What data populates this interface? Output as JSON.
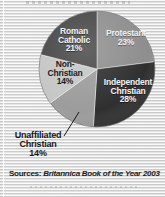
{
  "figure": {
    "background_color": "#dcdcdc",
    "texture": "horizontal-scanline"
  },
  "source_note": {
    "label": "Sources:",
    "title": "Britannica Book of the Year 2003"
  },
  "chart_data": {
    "type": "pie",
    "title": "",
    "subtitle": "",
    "xlabel": "",
    "ylabel": "",
    "legend_position": "none",
    "grid": false,
    "start_angle_deg": 0,
    "direction": "clockwise",
    "center": {
      "x": 97,
      "y": 69
    },
    "radius": 58,
    "units": "percent",
    "total": 100,
    "categories": [
      "Protestant",
      "Independent Christian",
      "Unaffiliated Christian",
      "Non-Christian",
      "Roman Catholic"
    ],
    "values": [
      23,
      28,
      14,
      14,
      21
    ],
    "slices": [
      {
        "name": "Protestant",
        "label_line1": "Protestant",
        "label_line2": "",
        "value": 23,
        "pct_text": "23%",
        "color": "#8e8e8e",
        "label_placement": "inside",
        "label_color": "#f2f2f2"
      },
      {
        "name": "Independent Christian",
        "label_line1": "Independent",
        "label_line2": "Christian",
        "value": 28,
        "pct_text": "28%",
        "color": "#2f2f2f",
        "label_placement": "inside",
        "label_color": "#f4f4f4"
      },
      {
        "name": "Unaffiliated Christian",
        "label_line1": "Unaffiliated",
        "label_line2": "Christian",
        "value": 14,
        "pct_text": "14%",
        "color": "#9c9c9c",
        "label_placement": "outside-leader",
        "label_color": "#161616"
      },
      {
        "name": "Non-Christian",
        "label_line1": "Non-",
        "label_line2": "Christian",
        "value": 14,
        "pct_text": "14%",
        "color": "#c6c6c6",
        "label_placement": "inside",
        "label_color": "#1c1c1c"
      },
      {
        "name": "Roman Catholic",
        "label_line1": "Roman",
        "label_line2": "Catholic",
        "value": 21,
        "pct_text": "21%",
        "color": "#474747",
        "label_placement": "inside",
        "label_color": "#f4f4f4"
      }
    ]
  }
}
